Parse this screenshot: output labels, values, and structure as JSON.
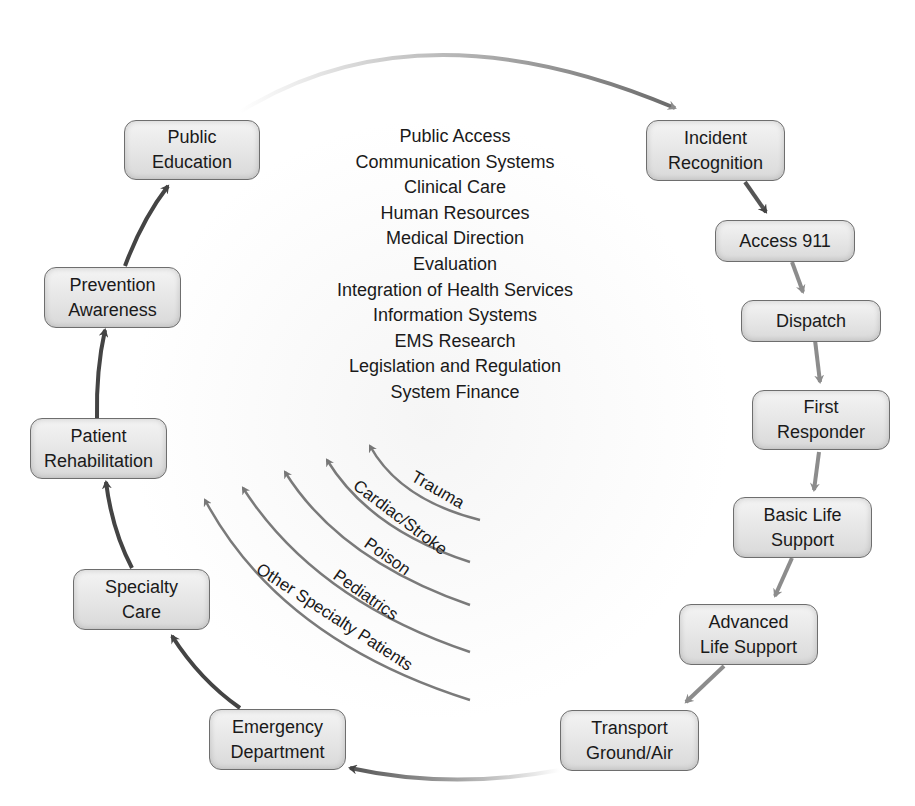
{
  "diagram": {
    "type": "EMS system cycle",
    "nodes": [
      {
        "id": "public-education",
        "lines": [
          "Public",
          "Education"
        ]
      },
      {
        "id": "incident-recognition",
        "lines": [
          "Incident",
          "Recognition"
        ]
      },
      {
        "id": "access-911",
        "lines": [
          "Access 911"
        ]
      },
      {
        "id": "dispatch",
        "lines": [
          "Dispatch"
        ]
      },
      {
        "id": "first-responder",
        "lines": [
          "First",
          "Responder"
        ]
      },
      {
        "id": "basic-life-support",
        "lines": [
          "Basic Life",
          "Support"
        ]
      },
      {
        "id": "advanced-life-support",
        "lines": [
          "Advanced",
          "Life Support"
        ]
      },
      {
        "id": "transport",
        "lines": [
          "Transport",
          "Ground/Air"
        ]
      },
      {
        "id": "emergency-department",
        "lines": [
          "Emergency",
          "Department"
        ]
      },
      {
        "id": "specialty-care",
        "lines": [
          "Specialty",
          "Care"
        ]
      },
      {
        "id": "patient-rehabilitation",
        "lines": [
          "Patient",
          "Rehabilitation"
        ]
      },
      {
        "id": "prevention-awareness",
        "lines": [
          "Prevention",
          "Awareness"
        ]
      }
    ],
    "components": [
      "Public Access",
      "Communication Systems",
      "Clinical Care",
      "Human Resources",
      "Medical Direction",
      "Evaluation",
      "Integration of Health Services",
      "Information Systems",
      "EMS Research",
      "Legislation and Regulation",
      "System Finance"
    ],
    "specialty_arcs": [
      "Trauma",
      "Cardiac/Stroke",
      "Poison",
      "Pediatrics",
      "Other Specialty Patients"
    ],
    "colors": {
      "node_border": "#6e6e6e",
      "arrow_dark": "#444444",
      "arrow_light": "#8c8c8c",
      "arc": "#7a7a7a"
    }
  }
}
